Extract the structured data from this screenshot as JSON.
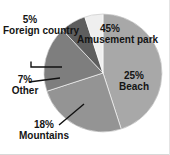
{
  "chart_data": {
    "type": "pie",
    "title": "",
    "xlabel": "",
    "ylabel": "",
    "legend_position": "none",
    "grid": false,
    "units": "percent",
    "total": 100,
    "categories": [
      "Amusement park",
      "Beach",
      "Mountains",
      "Other",
      "Foreign country"
    ],
    "values": [
      45,
      25,
      18,
      7,
      5
    ],
    "slices": [
      {
        "label": "Amusement park",
        "value": 45,
        "pct_text": "45%",
        "name_text": "Amusement park",
        "color": "#a8a8a8",
        "label_placement": "inside",
        "start_angle": 0,
        "end_angle": 162
      },
      {
        "label": "Beach",
        "value": 25,
        "pct_text": "25%",
        "name_text": "Beach",
        "color": "#949494",
        "label_placement": "inside",
        "start_angle": 162,
        "end_angle": 252
      },
      {
        "label": "Mountains",
        "value": 18,
        "pct_text": "18%",
        "name_text": "Mountains",
        "color": "#7e7e7e",
        "label_placement": "outside-leader",
        "start_angle": 252,
        "end_angle": 316.8
      },
      {
        "label": "Other",
        "value": 7,
        "pct_text": "7%",
        "name_text": "Other",
        "color": "#5e5e5e",
        "label_placement": "outside-leader",
        "start_angle": 316.8,
        "end_angle": 342
      },
      {
        "label": "Foreign country",
        "value": 5,
        "pct_text": "5%",
        "name_text": "Foreign country",
        "color": "#efefef",
        "label_placement": "outside-leader",
        "start_angle": 342,
        "end_angle": 360
      }
    ]
  },
  "labels": {
    "amusement": {
      "pct": "45%",
      "name": "Amusement park"
    },
    "beach": {
      "pct": "25%",
      "name": "Beach"
    },
    "mountains": {
      "pct": "18%",
      "name": "Mountains"
    },
    "other": {
      "pct": "7%",
      "name": "Other"
    },
    "foreign": {
      "pct": "5%",
      "name": "Foreign country"
    }
  },
  "colors": {
    "amusement": "#a8a8a8",
    "beach": "#949494",
    "mountains": "#7e7e7e",
    "other": "#5e5e5e",
    "foreign": "#efefef",
    "outline": "#6b6b6b",
    "leader": "#111111",
    "text": "#141414",
    "background": "#ffffff"
  },
  "geometry": {
    "center_x": 103,
    "center_y": 73,
    "radius": 59
  }
}
